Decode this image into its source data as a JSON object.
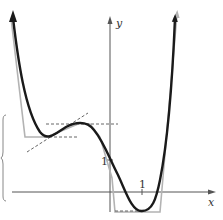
{
  "figure": {
    "type": "function-graph",
    "axes": {
      "x_label": "x",
      "y_label": "y",
      "x_tick_label": "1",
      "y_tick_label": "1"
    },
    "colors": {
      "curve": "#1a1a1a",
      "approximation": "#b3b3b3",
      "axes": "#555555",
      "dashed": "#555555",
      "brace": "#888888"
    },
    "curves": [
      {
        "name": "polynomial-curve",
        "style": "solid-thick-black"
      },
      {
        "name": "piecewise-linear-approximation",
        "style": "solid-gray"
      }
    ],
    "annotations": [
      {
        "name": "tangent-line",
        "style": "dashed"
      },
      {
        "name": "local-min-level",
        "style": "dashed-horizontal"
      },
      {
        "name": "local-max-level",
        "style": "dashed-horizontal"
      },
      {
        "name": "global-min-level",
        "style": "dashed-horizontal"
      },
      {
        "name": "left-brace",
        "style": "thin-bracket"
      }
    ]
  }
}
